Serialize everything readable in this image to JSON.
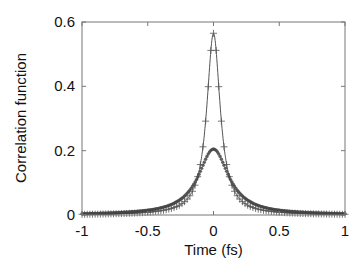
{
  "chart_data": {
    "type": "line",
    "title": "",
    "xlabel": "Time (fs)",
    "ylabel": "Correlation function",
    "xlim": [
      -1,
      1
    ],
    "ylim": [
      0,
      0.6
    ],
    "x_ticks": [
      -1,
      -0.5,
      0,
      0.5,
      1
    ],
    "x_tick_labels": [
      "-1",
      "-0.5",
      "0",
      "0.5",
      "1"
    ],
    "y_ticks": [
      0,
      0.2,
      0.4,
      0.6
    ],
    "y_tick_labels": [
      "0",
      "0.2",
      "0.4",
      "0.6"
    ],
    "grid": false,
    "legend": null,
    "series": [
      {
        "name": "line-with-plus-markers",
        "style": "line+plus",
        "color": "#555555",
        "peak": 0.565,
        "shape": "sharp peak centered at t=0 (width ~0.08 fs)",
        "x": [
          -1,
          -0.5,
          -0.3,
          -0.2,
          -0.15,
          -0.1,
          -0.075,
          -0.05,
          -0.025,
          0,
          0.025,
          0.05,
          0.075,
          0.1,
          0.15,
          0.2,
          0.3,
          0.5,
          1
        ],
        "values": [
          0.005,
          0.015,
          0.04,
          0.075,
          0.11,
          0.18,
          0.25,
          0.35,
          0.48,
          0.565,
          0.48,
          0.35,
          0.25,
          0.18,
          0.11,
          0.075,
          0.04,
          0.015,
          0.005
        ]
      },
      {
        "name": "dot-markers",
        "style": "markers",
        "color": "#444444",
        "peak": 0.205,
        "shape": "broader peak centered at t=0 (width ~0.15 fs)",
        "x": [
          -1,
          -0.5,
          -0.3,
          -0.2,
          -0.15,
          -0.1,
          -0.05,
          0,
          0.05,
          0.1,
          0.15,
          0.2,
          0.3,
          0.5,
          1
        ],
        "values": [
          0.005,
          0.02,
          0.05,
          0.085,
          0.115,
          0.15,
          0.19,
          0.205,
          0.19,
          0.15,
          0.115,
          0.085,
          0.05,
          0.02,
          0.005
        ]
      }
    ]
  }
}
